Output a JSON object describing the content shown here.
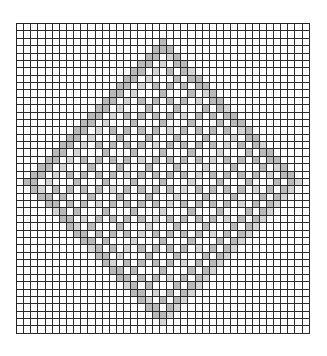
{
  "chart_title": "",
  "grid": {
    "columns": 41,
    "rows": 42,
    "line_color": "#2a2a2a",
    "background_color": "#ffffff",
    "fill_color": "#b9b9b9",
    "light_fill_color": "#d4d4d4"
  },
  "pattern": {
    "motif": "diamond-lattice",
    "center_column": 20,
    "center_row": 21,
    "outer_radius": 19,
    "band_width": 2,
    "inner_lattice_spacing": 4
  }
}
